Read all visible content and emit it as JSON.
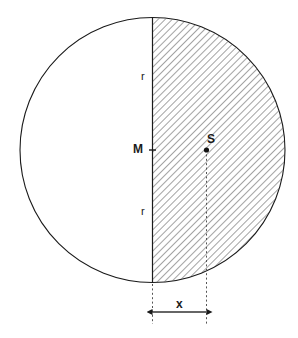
{
  "figure": {
    "background_color": "#ffffff",
    "stroke_color": "#1a1a1a",
    "hatch_color": "#333333"
  },
  "labels": {
    "radius_top": "r",
    "radius_bottom": "r",
    "center": "M",
    "centroid": "S",
    "distance": "x"
  },
  "geometry": {
    "circle": {
      "center_x": 152.5,
      "center_y": 150,
      "radius": 132.5
    },
    "diameter_line": {
      "x": 152.5,
      "y_top": 17.5,
      "y_bottom": 282.5
    },
    "centroid_point": {
      "x": 206.5,
      "y": 150
    },
    "center_point": {
      "x": 152.5,
      "y": 150
    },
    "dimension_line": {
      "y": 312,
      "x_start": 152.5,
      "x_end": 206.5
    },
    "extension_lines": [
      {
        "x": 152.5,
        "y_top": 283,
        "y_bottom": 325
      },
      {
        "x": 206.5,
        "y_top": 150,
        "y_bottom": 325
      }
    ],
    "hatch_region": "right-half-disc",
    "hatch_angle_deg": 45,
    "hatch_spacing_px": 5
  }
}
